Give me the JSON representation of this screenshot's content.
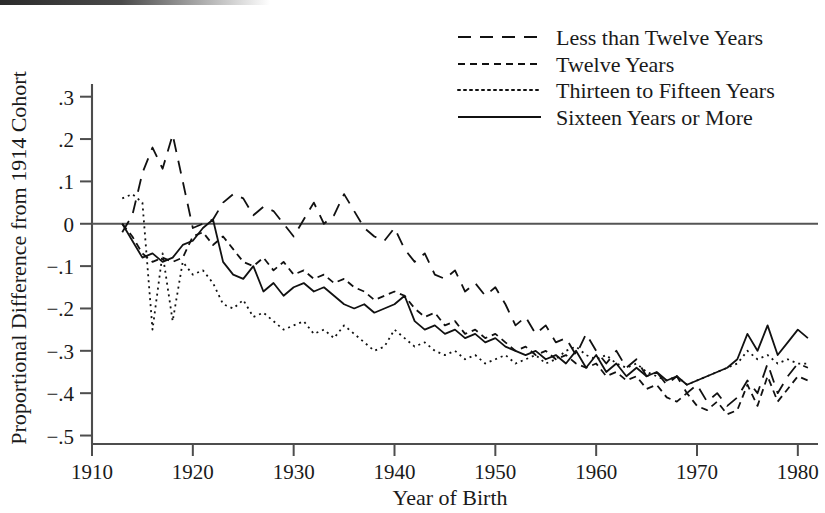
{
  "chart_data": {
    "type": "line",
    "title": "",
    "xlabel": "Year of Birth",
    "ylabel": "Proportional Difference from 1914 Cohort",
    "xlim": [
      1910,
      1982
    ],
    "ylim": [
      -0.52,
      0.33
    ],
    "xticks": [
      1910,
      1920,
      1930,
      1940,
      1950,
      1960,
      1970,
      1980
    ],
    "xtick_labels": [
      "1910",
      "1920",
      "1930",
      "1940",
      "1950",
      "1960",
      "1970",
      "1980"
    ],
    "yticks": [
      0.3,
      0.2,
      0.1,
      0,
      -0.1,
      -0.2,
      -0.3,
      -0.4,
      -0.5
    ],
    "ytick_labels": [
      ".3",
      ".2",
      ".1",
      "0",
      "−.1",
      "−.2",
      "−.3",
      "−.4",
      "−.5"
    ],
    "grid": false,
    "legend_position": "top-right",
    "reference_line_y": 0,
    "series": [
      {
        "name": "Less than Twelve Years",
        "style": "long-dash",
        "dash_pattern": "13,9",
        "x": [
          1913,
          1914,
          1915,
          1916,
          1917,
          1918,
          1919,
          1920,
          1921,
          1922,
          1923,
          1924,
          1925,
          1926,
          1927,
          1928,
          1929,
          1930,
          1931,
          1932,
          1933,
          1934,
          1935,
          1936,
          1937,
          1938,
          1939,
          1940,
          1941,
          1942,
          1943,
          1944,
          1945,
          1946,
          1947,
          1948,
          1949,
          1950,
          1951,
          1952,
          1953,
          1954,
          1955,
          1956,
          1957,
          1958,
          1959,
          1960,
          1961,
          1962,
          1963,
          1964,
          1965,
          1966,
          1967,
          1968,
          1969,
          1970,
          1971,
          1972,
          1973,
          1974,
          1975,
          1976,
          1977,
          1978,
          1979,
          1980,
          1981
        ],
        "y": [
          -0.02,
          0.02,
          0.12,
          0.18,
          0.13,
          0.21,
          0.1,
          -0.01,
          0.0,
          0.01,
          0.05,
          0.07,
          0.06,
          0.02,
          0.04,
          0.03,
          0.0,
          -0.03,
          0.01,
          0.05,
          0.0,
          0.02,
          0.07,
          0.03,
          -0.01,
          -0.03,
          -0.04,
          -0.01,
          -0.06,
          -0.09,
          -0.07,
          -0.12,
          -0.13,
          -0.11,
          -0.16,
          -0.14,
          -0.17,
          -0.15,
          -0.19,
          -0.24,
          -0.22,
          -0.26,
          -0.24,
          -0.28,
          -0.27,
          -0.31,
          -0.26,
          -0.3,
          -0.33,
          -0.3,
          -0.34,
          -0.32,
          -0.36,
          -0.35,
          -0.38,
          -0.36,
          -0.4,
          -0.38,
          -0.42,
          -0.4,
          -0.43,
          -0.41,
          -0.37,
          -0.4,
          -0.33,
          -0.4,
          -0.36,
          -0.33,
          -0.34
        ]
      },
      {
        "name": "Twelve Years",
        "style": "short-dash",
        "dash_pattern": "7,5",
        "x": [
          1913,
          1914,
          1915,
          1916,
          1917,
          1918,
          1919,
          1920,
          1921,
          1922,
          1923,
          1924,
          1925,
          1926,
          1927,
          1928,
          1929,
          1930,
          1931,
          1932,
          1933,
          1934,
          1935,
          1936,
          1937,
          1938,
          1939,
          1940,
          1941,
          1942,
          1943,
          1944,
          1945,
          1946,
          1947,
          1948,
          1949,
          1950,
          1951,
          1952,
          1953,
          1954,
          1955,
          1956,
          1957,
          1958,
          1959,
          1960,
          1961,
          1962,
          1963,
          1964,
          1965,
          1966,
          1967,
          1968,
          1969,
          1970,
          1971,
          1972,
          1973,
          1974,
          1975,
          1976,
          1977,
          1978,
          1979,
          1980,
          1981
        ],
        "y": [
          0.0,
          -0.03,
          -0.07,
          -0.09,
          -0.08,
          -0.09,
          -0.08,
          -0.03,
          -0.02,
          -0.05,
          -0.03,
          -0.06,
          -0.09,
          -0.1,
          -0.08,
          -0.11,
          -0.09,
          -0.12,
          -0.11,
          -0.13,
          -0.12,
          -0.14,
          -0.13,
          -0.15,
          -0.16,
          -0.18,
          -0.17,
          -0.16,
          -0.17,
          -0.2,
          -0.22,
          -0.21,
          -0.24,
          -0.23,
          -0.26,
          -0.25,
          -0.27,
          -0.26,
          -0.28,
          -0.3,
          -0.29,
          -0.31,
          -0.3,
          -0.32,
          -0.31,
          -0.33,
          -0.34,
          -0.33,
          -0.36,
          -0.35,
          -0.37,
          -0.36,
          -0.39,
          -0.38,
          -0.41,
          -0.42,
          -0.4,
          -0.43,
          -0.44,
          -0.42,
          -0.45,
          -0.44,
          -0.38,
          -0.43,
          -0.36,
          -0.42,
          -0.39,
          -0.36,
          -0.37
        ]
      },
      {
        "name": "Thirteen to Fifteen Years",
        "style": "dotted",
        "dash_pattern": "2,4",
        "x": [
          1913,
          1914,
          1915,
          1916,
          1917,
          1918,
          1919,
          1920,
          1921,
          1922,
          1923,
          1924,
          1925,
          1926,
          1927,
          1928,
          1929,
          1930,
          1931,
          1932,
          1933,
          1934,
          1935,
          1936,
          1937,
          1938,
          1939,
          1940,
          1941,
          1942,
          1943,
          1944,
          1945,
          1946,
          1947,
          1948,
          1949,
          1950,
          1951,
          1952,
          1953,
          1954,
          1955,
          1956,
          1957,
          1958,
          1959,
          1960,
          1961,
          1962,
          1963,
          1964,
          1965,
          1966,
          1967,
          1968,
          1969,
          1970,
          1971,
          1972,
          1973,
          1974,
          1975,
          1976,
          1977,
          1978,
          1979,
          1980,
          1981
        ],
        "y": [
          0.06,
          0.07,
          0.05,
          -0.25,
          -0.07,
          -0.23,
          -0.09,
          -0.12,
          -0.11,
          -0.14,
          -0.19,
          -0.2,
          -0.18,
          -0.22,
          -0.21,
          -0.23,
          -0.25,
          -0.24,
          -0.23,
          -0.26,
          -0.25,
          -0.27,
          -0.24,
          -0.26,
          -0.28,
          -0.3,
          -0.29,
          -0.25,
          -0.27,
          -0.29,
          -0.28,
          -0.3,
          -0.31,
          -0.3,
          -0.32,
          -0.31,
          -0.33,
          -0.32,
          -0.31,
          -0.33,
          -0.32,
          -0.31,
          -0.33,
          -0.32,
          -0.3,
          -0.29,
          -0.31,
          -0.32,
          -0.31,
          -0.33,
          -0.34,
          -0.33,
          -0.35,
          -0.36,
          -0.37,
          -0.36,
          -0.38,
          -0.37,
          -0.36,
          -0.35,
          -0.34,
          -0.33,
          -0.3,
          -0.32,
          -0.31,
          -0.33,
          -0.32,
          -0.33,
          -0.33
        ]
      },
      {
        "name": "Sixteen Years or More",
        "style": "solid",
        "dash_pattern": "none",
        "x": [
          1913,
          1914,
          1915,
          1916,
          1917,
          1918,
          1919,
          1920,
          1921,
          1922,
          1923,
          1924,
          1925,
          1926,
          1927,
          1928,
          1929,
          1930,
          1931,
          1932,
          1933,
          1934,
          1935,
          1936,
          1937,
          1938,
          1939,
          1940,
          1941,
          1942,
          1943,
          1944,
          1945,
          1946,
          1947,
          1948,
          1949,
          1950,
          1951,
          1952,
          1953,
          1954,
          1955,
          1956,
          1957,
          1958,
          1959,
          1960,
          1961,
          1962,
          1963,
          1964,
          1965,
          1966,
          1967,
          1968,
          1969,
          1970,
          1971,
          1972,
          1973,
          1974,
          1975,
          1976,
          1977,
          1978,
          1979,
          1980,
          1981
        ],
        "y": [
          0.0,
          -0.04,
          -0.08,
          -0.07,
          -0.09,
          -0.08,
          -0.05,
          -0.04,
          -0.01,
          0.01,
          -0.09,
          -0.12,
          -0.13,
          -0.1,
          -0.16,
          -0.14,
          -0.17,
          -0.15,
          -0.14,
          -0.16,
          -0.15,
          -0.17,
          -0.19,
          -0.2,
          -0.19,
          -0.21,
          -0.2,
          -0.19,
          -0.17,
          -0.23,
          -0.25,
          -0.24,
          -0.26,
          -0.25,
          -0.27,
          -0.26,
          -0.28,
          -0.27,
          -0.29,
          -0.3,
          -0.31,
          -0.3,
          -0.32,
          -0.31,
          -0.33,
          -0.3,
          -0.34,
          -0.31,
          -0.35,
          -0.33,
          -0.36,
          -0.34,
          -0.36,
          -0.35,
          -0.37,
          -0.36,
          -0.38,
          -0.37,
          -0.36,
          -0.35,
          -0.34,
          -0.32,
          -0.26,
          -0.3,
          -0.24,
          -0.31,
          -0.28,
          -0.25,
          -0.27
        ]
      }
    ]
  },
  "legend": {
    "items": [
      {
        "label": "Less than Twelve Years"
      },
      {
        "label": "Twelve Years"
      },
      {
        "label": "Thirteen to Fifteen Years"
      },
      {
        "label": "Sixteen Years or More"
      }
    ]
  },
  "axes": {
    "x_title": "Year of Birth",
    "y_title": "Proportional Difference from 1914 Cohort"
  }
}
